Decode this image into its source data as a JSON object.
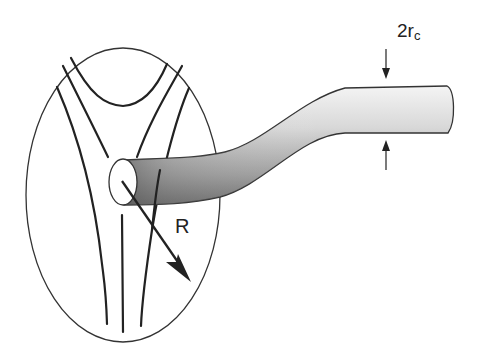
{
  "diagram": {
    "type": "schematic",
    "labels": {
      "core_diameter": "2r",
      "core_diameter_sub": "c",
      "distance": "R"
    },
    "elements": [
      {
        "name": "ellipse-region",
        "kind": "outline"
      },
      {
        "name": "field-lines",
        "count": 7
      },
      {
        "name": "flux-tube",
        "kind": "shaded-cylinder"
      },
      {
        "name": "radius-arrow",
        "label": "R"
      },
      {
        "name": "diameter-arrows",
        "label": "2rc"
      }
    ],
    "colors": {
      "stroke": "#222222",
      "tube_light": "#f2f2f2",
      "tube_dark": "#6a6a6a",
      "background": "#ffffff"
    }
  }
}
